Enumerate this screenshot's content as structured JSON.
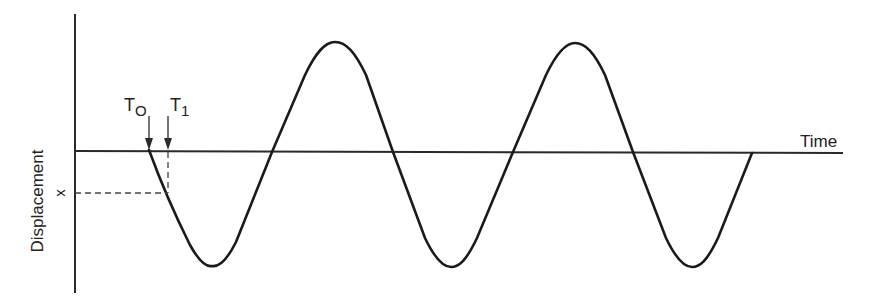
{
  "diagram": {
    "title": "",
    "y_axis_label": "Displacement",
    "x_axis_label": "Time",
    "displacement_marker": "x",
    "markers": [
      {
        "id": "t0",
        "label": "T",
        "subscript": "O"
      },
      {
        "id": "t1",
        "label": "T",
        "subscript": "1"
      }
    ],
    "waveform": {
      "type": "sine",
      "start_phase": "descending zero-crossing at T0",
      "cycles": 2.5,
      "zero_crossings_px": [
        149,
        272,
        393,
        513,
        633,
        752
      ],
      "peaks_px": [
        [
          335,
          42
        ],
        [
          575,
          43
        ]
      ],
      "troughs_px": [
        [
          212,
          266
        ],
        [
          451,
          267
        ],
        [
          692,
          267
        ]
      ]
    },
    "colors": {
      "line": "#1a1a1a",
      "background": "#ffffff"
    }
  }
}
